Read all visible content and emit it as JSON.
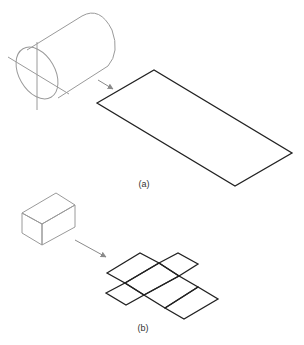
{
  "figure": {
    "panels": [
      {
        "id": "a",
        "label": "(a)",
        "description": "Cylinder with axis lines unrolled to a flat rectangular development",
        "source_shape": "cylinder",
        "result_shape": "rectangle"
      },
      {
        "id": "b",
        "label": "(b)",
        "description": "Rectangular box unfolded into a flat net of six faces",
        "source_shape": "rectangular-prism",
        "result_shape": "box-net"
      }
    ],
    "colors": {
      "source_stroke": "#9a9a9a",
      "result_stroke": "#222222",
      "arrow": "#8a8a8a",
      "label": "#333333"
    }
  }
}
